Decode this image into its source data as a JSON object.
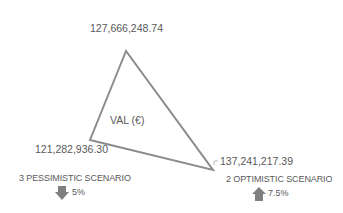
{
  "diagram": {
    "center_label": "VAL (€)",
    "line_color": "#8c8c8c",
    "arrow_color": "#7f7f7f",
    "vertices": {
      "top": {
        "value": "127,666,248.74"
      },
      "left": {
        "value": "121,282,936.30"
      },
      "right": {
        "value": "137,241,217.39"
      }
    },
    "scenarios": [
      {
        "label": "3  PESSIMISTIC SCENARIO",
        "direction": "down",
        "percent": "5%"
      },
      {
        "label": "2 OPTIMISTIC SCENARIO",
        "direction": "up",
        "percent": "7.5%"
      }
    ]
  }
}
